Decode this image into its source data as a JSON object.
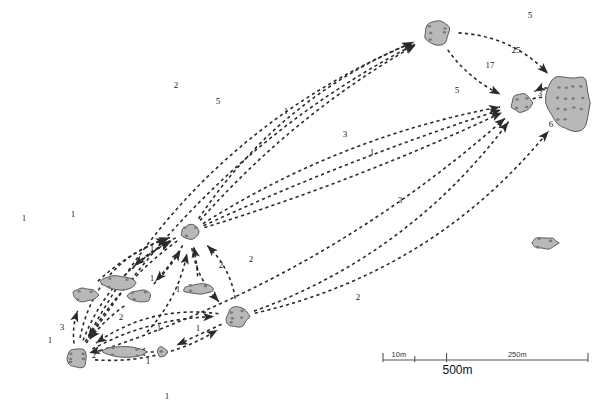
{
  "figure": {
    "type": "network-map"
  },
  "chart_data": {
    "type": "scatter",
    "title": "",
    "xlabel": "",
    "ylabel": "",
    "grid": false,
    "legend": "none",
    "nodes": [
      {
        "id": "n-top",
        "label": "",
        "x": 437,
        "y": 33,
        "shape": "round-lobed",
        "rx": 13,
        "ry": 11,
        "dots": 5
      },
      {
        "id": "n-right-small",
        "label": "",
        "x": 522,
        "y": 103,
        "shape": "round-lobed",
        "rx": 11,
        "ry": 9,
        "dots": 4
      },
      {
        "id": "n-large-right",
        "label": "",
        "x": 570,
        "y": 103,
        "shape": "oval-large",
        "rx": 22,
        "ry": 30,
        "dots": 14
      },
      {
        "id": "n-hub-center",
        "label": "",
        "x": 190,
        "y": 232,
        "shape": "round-small",
        "rx": 9,
        "ry": 7,
        "dots": 3
      },
      {
        "id": "n-isolated-right",
        "label": "",
        "x": 545,
        "y": 243,
        "shape": "blob-flat",
        "rx": 13,
        "ry": 6,
        "dots": 3
      },
      {
        "id": "n-left-oval",
        "label": "",
        "x": 85,
        "y": 295,
        "shape": "blob-flat",
        "rx": 12,
        "ry": 7,
        "dots": 3
      },
      {
        "id": "n-mid-tadpole",
        "label": "",
        "x": 118,
        "y": 283,
        "shape": "tadpole",
        "rx": 16,
        "ry": 7,
        "dots": 3
      },
      {
        "id": "n-mid-bean",
        "label": "",
        "x": 140,
        "y": 296,
        "shape": "blob-flat",
        "rx": 12,
        "ry": 6,
        "dots": 3
      },
      {
        "id": "n-mid-flat",
        "label": "",
        "x": 198,
        "y": 289,
        "shape": "blob-flat",
        "rx": 15,
        "ry": 5,
        "dots": 3
      },
      {
        "id": "n-right-round",
        "label": "",
        "x": 237,
        "y": 317,
        "shape": "round-lobed",
        "rx": 11,
        "ry": 10,
        "dots": 5
      },
      {
        "id": "n-bottom-round",
        "label": "",
        "x": 77,
        "y": 358,
        "shape": "round-lobed",
        "rx": 11,
        "ry": 10,
        "dots": 5
      },
      {
        "id": "n-bottom-long",
        "label": "",
        "x": 125,
        "y": 352,
        "shape": "tadpole",
        "rx": 22,
        "ry": 6,
        "dots": 4
      },
      {
        "id": "n-tiny-dot",
        "label": "",
        "x": 162,
        "y": 352,
        "shape": "tiny",
        "rx": 5,
        "ry": 5,
        "dots": 1
      }
    ],
    "edge_labels": [
      {
        "text": "5",
        "x": 530,
        "y": 18
      },
      {
        "text": "25",
        "x": 516,
        "y": 53
      },
      {
        "text": "17",
        "x": 490,
        "y": 68
      },
      {
        "text": "5",
        "x": 457,
        "y": 93
      },
      {
        "text": "3",
        "x": 540,
        "y": 96
      },
      {
        "text": "6",
        "x": 551,
        "y": 127
      },
      {
        "text": "2",
        "x": 176,
        "y": 88
      },
      {
        "text": "5",
        "x": 218,
        "y": 104
      },
      {
        "text": "1",
        "x": 286,
        "y": 114
      },
      {
        "text": "3",
        "x": 345,
        "y": 137
      },
      {
        "text": "1",
        "x": 372,
        "y": 155
      },
      {
        "text": "3",
        "x": 400,
        "y": 203
      },
      {
        "text": "2",
        "x": 358,
        "y": 300
      },
      {
        "text": "1",
        "x": 24,
        "y": 221
      },
      {
        "text": "1",
        "x": 73,
        "y": 217
      },
      {
        "text": "1",
        "x": 152,
        "y": 251
      },
      {
        "text": "1",
        "x": 197,
        "y": 271
      },
      {
        "text": "2",
        "x": 221,
        "y": 268
      },
      {
        "text": "2",
        "x": 251,
        "y": 262
      },
      {
        "text": "1",
        "x": 152,
        "y": 281
      },
      {
        "text": "1",
        "x": 178,
        "y": 292
      },
      {
        "text": "3",
        "x": 62,
        "y": 330
      },
      {
        "text": "1",
        "x": 50,
        "y": 343
      },
      {
        "text": "2",
        "x": 121,
        "y": 320
      },
      {
        "text": "1",
        "x": 159,
        "y": 331
      },
      {
        "text": "1",
        "x": 198,
        "y": 331
      },
      {
        "text": "2",
        "x": 94,
        "y": 358
      },
      {
        "text": "1",
        "x": 148,
        "y": 364
      },
      {
        "text": "1",
        "x": 167,
        "y": 399
      }
    ],
    "scale_bar": {
      "ticks": [
        "10m",
        "250m"
      ],
      "main_label": "500m",
      "x_start": 383,
      "x_end": 588,
      "y": 360
    }
  },
  "scale": {
    "tick_left_label": "10m",
    "tick_right_label": "250m",
    "total_label": "500m"
  }
}
